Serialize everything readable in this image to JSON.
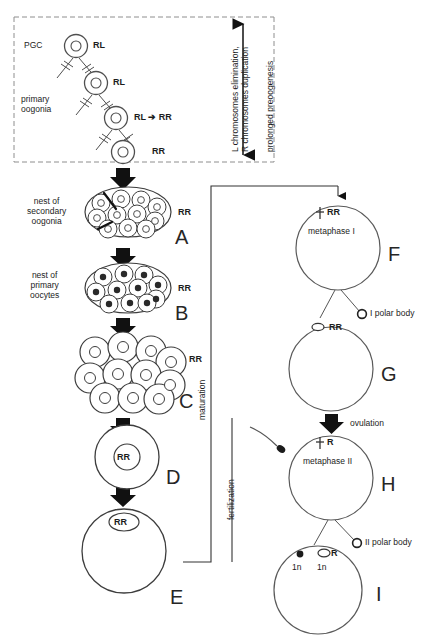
{
  "diagram": {
    "top_panel": {
      "pgc_label": "PGC",
      "oogonia_label": "primary\noogonia",
      "cells": [
        {
          "id": "pgc",
          "genotype": "RL"
        },
        {
          "id": "div1",
          "genotype": "RL"
        },
        {
          "id": "div2",
          "genotype": "RL ➔ RR"
        },
        {
          "id": "div3",
          "genotype": "RR"
        }
      ],
      "bracket_labels": [
        "L chromosomes elimination,\nR chromosomes duplication",
        "prolonged preoogenesis"
      ]
    },
    "left_column": {
      "labels": [
        "nest of\nsecondary\noogonia",
        "nest of\nprimary\noocytes"
      ],
      "stages": [
        {
          "letter": "A",
          "genotype": "RR",
          "kind": "nest-oval-secondary"
        },
        {
          "letter": "B",
          "genotype": "RR",
          "kind": "nest-oval-primary"
        },
        {
          "letter": "C",
          "genotype": "RR",
          "kind": "cluster-large"
        },
        {
          "letter": "D",
          "genotype": "RR",
          "kind": "single-oocyte-centered"
        },
        {
          "letter": "E",
          "genotype": "RR",
          "kind": "single-oocyte-apical"
        }
      ]
    },
    "connectors": {
      "maturation_label": "maturation",
      "fertilization_label": "fertilization"
    },
    "right_column": {
      "stages": [
        {
          "letter": "F",
          "genotype": "RR",
          "phase": "metaphase I",
          "spindle": true
        },
        {
          "letter": "G",
          "genotype": "RR",
          "polar_body": "I polar body"
        },
        {
          "letter": "H",
          "genotype": "R",
          "phase": "metaphase II",
          "spindle": true,
          "sperm": true
        },
        {
          "letter": "I",
          "genotype": "R",
          "polar_body": "II polar body",
          "ploidy_left": "1n",
          "ploidy_right": "1n"
        }
      ],
      "ovulation_label": "ovulation"
    },
    "colors": {
      "ink": "#1c1c1c",
      "outline": "#555555",
      "dashed": "#8a8a8a",
      "fill": "#ffffff"
    }
  }
}
